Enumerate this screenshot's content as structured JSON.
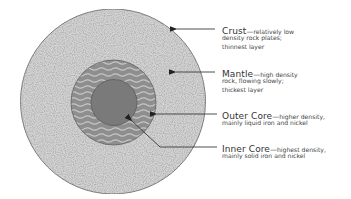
{
  "diagram": {
    "colors": {
      "crust_mantle_fill": "#d3d3d3",
      "outer_core_fill": "#8e8e8e",
      "outer_core_wave": "#c4c4c4",
      "inner_core_fill": "#7a7a7a",
      "outline": "#707070",
      "leader_line": "#3a3a3a",
      "text": "#333333"
    },
    "layers": [
      {
        "name": "Crust",
        "description_lines": [
          "relatively low",
          "density rock plates;",
          "thinnest layer"
        ]
      },
      {
        "name": "Mantle",
        "description_lines": [
          "high density",
          "rock, flowing slowly;",
          "thickest layer"
        ]
      },
      {
        "name": "Outer Core",
        "description_lines": [
          "higher density,",
          "mainly liquid iron and nickel"
        ]
      },
      {
        "name": "Inner Core",
        "description_lines": [
          "highest density,",
          "mainly solid iron and nickel"
        ]
      }
    ],
    "dash": "—"
  }
}
